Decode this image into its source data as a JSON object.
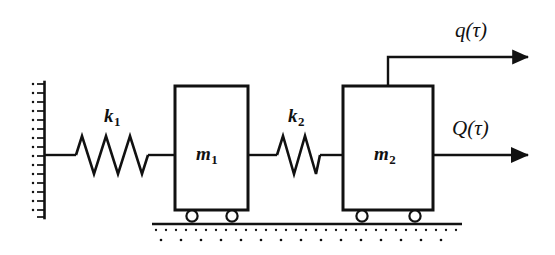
{
  "diagram": {
    "type": "mechanical-schematic",
    "stroke_color": "#111111",
    "background_color": "#ffffff",
    "labels": {
      "spring_1": "k",
      "spring_1_sub": "1",
      "spring_2": "k",
      "spring_2_sub": "2",
      "mass_1": "m",
      "mass_1_sub": "1",
      "mass_2": "m",
      "mass_2_sub": "2",
      "displacement": "q(τ)",
      "force": "Q(τ)"
    },
    "components": {
      "wall": {
        "name": "fixed-support-wall",
        "x": 44,
        "y_top": 82,
        "y_bottom": 218
      },
      "ground": {
        "name": "ground-surface",
        "x_start": 152,
        "x_end": 462,
        "y": 224
      },
      "mass_1_block": {
        "x": 175,
        "y": 86,
        "width": 73,
        "height": 124
      },
      "mass_2_block": {
        "x": 343,
        "y": 86,
        "width": 90,
        "height": 124
      },
      "spring_1": {
        "x_start": 76,
        "x_end": 148,
        "y": 155,
        "coils": 5
      },
      "spring_2": {
        "x_start": 277,
        "x_end": 320,
        "y": 155,
        "coils": 3
      },
      "wheels": [
        {
          "cx": 192,
          "cy": 216
        },
        {
          "cx": 232,
          "cy": 216
        },
        {
          "cx": 362,
          "cy": 216
        },
        {
          "cx": 415,
          "cy": 216
        }
      ],
      "displacement_arrow": {
        "stem_x": 388,
        "stem_y_top": 57,
        "arrow_y": 57,
        "arrow_x_end": 533
      },
      "force_arrow": {
        "x_start": 433,
        "x_end": 533,
        "y": 155
      }
    }
  }
}
